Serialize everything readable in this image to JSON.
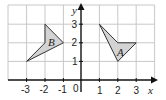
{
  "diagram": {
    "type": "coordinate-grid",
    "axes": {
      "x_label": "x",
      "y_label": "y",
      "origin_label": "0",
      "x_ticks": [
        "-3",
        "-2",
        "-1",
        "1",
        "2",
        "3"
      ],
      "y_ticks": [
        "1",
        "2",
        "3"
      ]
    },
    "shapes": [
      {
        "label": "B",
        "vertices": [
          [
            -2,
            3
          ],
          [
            -1,
            2
          ],
          [
            -3,
            1
          ],
          [
            -2,
            2
          ]
        ]
      },
      {
        "label": "A",
        "vertices": [
          [
            1,
            3
          ],
          [
            2,
            2
          ],
          [
            3,
            2
          ],
          [
            2,
            1
          ]
        ]
      }
    ],
    "colors": {
      "shape_fill": "#d3d3d3",
      "grid": "#c8c8c8",
      "axis": "#111111"
    }
  }
}
